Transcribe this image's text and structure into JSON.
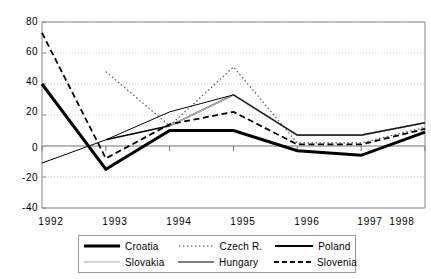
{
  "chart_data": {
    "type": "line",
    "title": "",
    "subtitle": "",
    "xlabel": "",
    "ylabel": "",
    "categories": [
      "1992",
      "1993",
      "1994",
      "1995",
      "1996",
      "1997",
      "1998"
    ],
    "ylim": [
      -40,
      80
    ],
    "yticks": [
      80,
      60,
      40,
      20,
      0,
      -20,
      -40
    ],
    "ytick_labels": [
      "80",
      "60",
      "40",
      "20",
      "0",
      "-20",
      "-40"
    ],
    "grid": true,
    "grid_style": "dotted horizontal",
    "legend_position": "bottom",
    "series": [
      {
        "name": "Croatia",
        "style": "thick-solid",
        "color": "#000000",
        "width": 3,
        "values": [
          40,
          -15,
          10,
          10,
          -3,
          -6,
          9
        ]
      },
      {
        "name": "Czech R.",
        "style": "dotted",
        "color": "#555555",
        "width": 1.2,
        "values": [
          null,
          48,
          13,
          51,
          2,
          2,
          12
        ]
      },
      {
        "name": "Poland",
        "style": "solid",
        "color": "#000000",
        "width": 1.6,
        "values": [
          null,
          4,
          13,
          33,
          7,
          7,
          15
        ]
      },
      {
        "name": "Slovakia",
        "style": "light-solid",
        "color": "#b8b8b8",
        "width": 1.2,
        "values": [
          null,
          null,
          13,
          33,
          7,
          7,
          15
        ]
      },
      {
        "name": "Hungary",
        "style": "thin-solid",
        "color": "#000000",
        "width": 1,
        "values": [
          -11,
          4,
          22,
          33,
          7,
          7,
          15
        ]
      },
      {
        "name": "Slovenia",
        "style": "dashed",
        "color": "#000000",
        "width": 1.8,
        "values": [
          73,
          -8,
          14,
          22,
          1,
          1,
          11
        ]
      }
    ]
  },
  "legend": {
    "rows": [
      [
        {
          "label": "Croatia",
          "swatch": "thick-solid-line-icon"
        },
        {
          "label": "Czech R.",
          "swatch": "dotted-line-icon"
        },
        {
          "label": "Poland",
          "swatch": "solid-line-icon"
        }
      ],
      [
        {
          "label": "Slovakia",
          "swatch": "light-solid-line-icon"
        },
        {
          "label": "Hungary",
          "swatch": "thin-solid-line-icon"
        },
        {
          "label": "Slovenia",
          "swatch": "dashed-line-icon"
        }
      ]
    ]
  },
  "colors": {
    "axis": "#888888",
    "grid": "#bbbbbb",
    "zero_line": "#a0a0a0",
    "plot_background": "#ffffff",
    "text": "#000000"
  }
}
